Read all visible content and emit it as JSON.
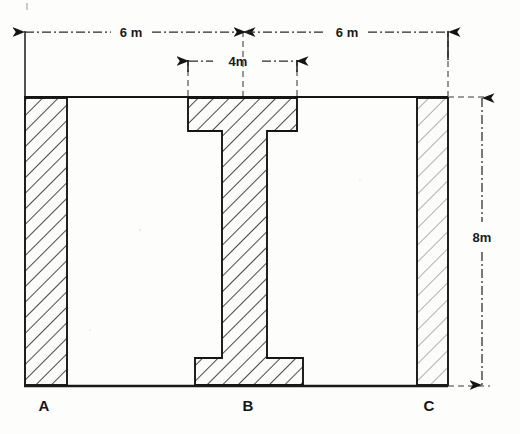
{
  "figure": {
    "kind": "structural-frame-elevation",
    "background_color": "#fdfdfc",
    "ink_color": "#151515"
  },
  "dimensions": {
    "span_left": {
      "label": "6 m",
      "value": 6,
      "unit": "m",
      "orientation": "horizontal",
      "from_node": "A",
      "to_node": "B"
    },
    "span_right": {
      "label": "6 m",
      "value": 6,
      "unit": "m",
      "orientation": "horizontal",
      "from_node": "B",
      "to_node": "C"
    },
    "flange_width": {
      "label": "4m",
      "value": 4,
      "unit": "m",
      "orientation": "horizontal",
      "applies_to": "column-b-flange"
    },
    "height": {
      "label": "8m",
      "value": 8,
      "unit": "m",
      "orientation": "vertical",
      "applies_to": "column-height"
    }
  },
  "nodes": [
    {
      "id": "A",
      "label": "A",
      "position": "left-base"
    },
    {
      "id": "B",
      "label": "B",
      "position": "center-base"
    },
    {
      "id": "C",
      "label": "C",
      "position": "right-base"
    }
  ],
  "members": [
    {
      "id": "column-a",
      "label": "A",
      "shape": "rectangular-section",
      "hatched": true,
      "hatch_style": "diagonal-45"
    },
    {
      "id": "column-b",
      "label": "B",
      "shape": "i-section",
      "hatched": true,
      "hatch_style": "diagonal-45",
      "note": "wide flanges top and bottom, narrow web"
    },
    {
      "id": "column-c",
      "label": "C",
      "shape": "rectangular-section",
      "hatched": true,
      "hatch_style": "diagonal-45",
      "note": "thinner than column A"
    },
    {
      "id": "beam",
      "label": "",
      "shape": "horizontal-line",
      "hatched": false
    }
  ]
}
